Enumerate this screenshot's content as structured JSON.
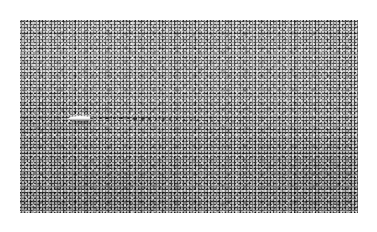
{
  "page": {
    "background_color": "#ffffff",
    "width": 377,
    "height": 232,
    "caption": ""
  },
  "photo": {
    "alt_description": "Overhead grayscale photograph of a coarse granular gray surface with a small bright white elongated object at left of center and a fading line of dark dots trailing to the right",
    "subject": "white elongated object on granular gray surface",
    "frame": {
      "left": 20,
      "top": 20,
      "width": 338,
      "height": 193
    },
    "border_color": "#ffffff",
    "tone": {
      "base_gray": "#848484",
      "light_gray": "#8d8d8d",
      "dark_gray": "#6d6d6d",
      "highlight": "#ffffff",
      "shadow": "#1d1d1d"
    }
  },
  "object": {
    "name": "bright-elongated-object",
    "x": 48,
    "y": 93,
    "width": 30,
    "height": 11,
    "color": "#ffffff",
    "orientation": "horizontal, pointed end facing right"
  },
  "trail": {
    "name": "dotted-trail",
    "description": "line of dark dots extending rightward from the object, drifting slightly downward and fading out",
    "color": "#1d1d1d",
    "start_x": 80,
    "end_x": 224,
    "dots": [
      {
        "x": 80,
        "y": 98.2,
        "r": 1.5,
        "o": 0.92
      },
      {
        "x": 87,
        "y": 98.3,
        "r": 1.6,
        "o": 0.95
      },
      {
        "x": 94,
        "y": 98.4,
        "r": 1.5,
        "o": 0.9
      },
      {
        "x": 101,
        "y": 98.5,
        "r": 1.6,
        "o": 0.93
      },
      {
        "x": 108,
        "y": 98.6,
        "r": 1.5,
        "o": 0.88
      },
      {
        "x": 115,
        "y": 98.7,
        "r": 1.6,
        "o": 0.9
      },
      {
        "x": 122,
        "y": 98.8,
        "r": 1.5,
        "o": 0.86
      },
      {
        "x": 129,
        "y": 98.9,
        "r": 1.5,
        "o": 0.84
      },
      {
        "x": 136,
        "y": 99.0,
        "r": 1.4,
        "o": 0.82
      },
      {
        "x": 143,
        "y": 99.2,
        "r": 1.5,
        "o": 0.8
      },
      {
        "x": 150,
        "y": 99.4,
        "r": 1.4,
        "o": 0.76
      },
      {
        "x": 157,
        "y": 99.6,
        "r": 1.4,
        "o": 0.74
      },
      {
        "x": 164,
        "y": 99.8,
        "r": 1.3,
        "o": 0.7
      },
      {
        "x": 171,
        "y": 100.1,
        "r": 1.3,
        "o": 0.66
      },
      {
        "x": 178,
        "y": 100.4,
        "r": 1.2,
        "o": 0.6
      },
      {
        "x": 185,
        "y": 100.7,
        "r": 1.2,
        "o": 0.55
      },
      {
        "x": 192,
        "y": 101.0,
        "r": 1.1,
        "o": 0.48
      },
      {
        "x": 199,
        "y": 101.4,
        "r": 1.1,
        "o": 0.42
      },
      {
        "x": 206,
        "y": 101.8,
        "r": 1.0,
        "o": 0.34
      },
      {
        "x": 213,
        "y": 102.2,
        "r": 0.9,
        "o": 0.26
      },
      {
        "x": 220,
        "y": 102.6,
        "r": 0.8,
        "o": 0.18
      }
    ]
  }
}
